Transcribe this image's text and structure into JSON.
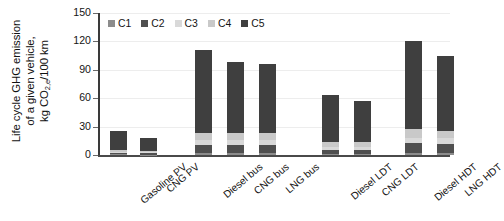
{
  "chart_data": {
    "type": "bar",
    "subtype": "stacked-bar",
    "title": "",
    "xlabel": "",
    "ylabel": "Life cycle GHG emission of a given vehicle, kg CO2,e/100 km",
    "ylabel_lines": [
      "Life cycle GHG emission",
      "of a given vehicle,",
      "kg CO₂,ₑ/100 km"
    ],
    "ylim": [
      0,
      150
    ],
    "yticks": [
      0,
      30,
      60,
      90,
      120,
      150
    ],
    "ytick_labels": [
      "0",
      "30",
      "60",
      "90",
      "120",
      "150"
    ],
    "grid": true,
    "legend_position": "top-left-inside",
    "categories": [
      "Gasoline PV",
      "CNG PV",
      "Diesel bus",
      "CNG bus",
      "LNG bus",
      "Diesel LDT",
      "CNG LDT",
      "Diesel HDT",
      "LNG HDT"
    ],
    "series": [
      {
        "name": "C1",
        "color": "#8c8c8c",
        "values": [
          0.6,
          0.5,
          2.0,
          2.0,
          2.0,
          1.2,
          1.2,
          2.5,
          2.5
        ]
      },
      {
        "name": "C2",
        "color": "#4f4f4f",
        "values": [
          1.8,
          1.6,
          8.6,
          8.7,
          8.8,
          4.6,
          4.6,
          9.8,
          9.6
        ]
      },
      {
        "name": "C3",
        "color": "#d9d9d9",
        "values": [
          1.2,
          1.1,
          5.0,
          5.1,
          5.0,
          3.0,
          3.1,
          6.0,
          5.8
        ]
      },
      {
        "name": "C4",
        "color": "#c9c9c9",
        "values": [
          1.4,
          1.3,
          8.0,
          7.9,
          7.7,
          4.5,
          4.6,
          9.2,
          7.4
        ]
      },
      {
        "name": "C5",
        "color": "#3f3f3f",
        "values": [
          20.5,
          13.5,
          87.4,
          74.3,
          72.5,
          49.7,
          43.5,
          93.5,
          79.7
        ]
      }
    ],
    "totals": [
      25.5,
      18.0,
      111.0,
      98.0,
      96.0,
      63.0,
      57.0,
      121.0,
      105.0
    ],
    "group_gaps_after": [
      "CNG PV",
      "LNG bus",
      "CNG LDT"
    ]
  },
  "legend": {
    "items": [
      {
        "label": "C1",
        "color": "#8c8c8c"
      },
      {
        "label": "C2",
        "color": "#4f4f4f"
      },
      {
        "label": "C3",
        "color": "#d9d9d9"
      },
      {
        "label": "C4",
        "color": "#c9c9c9"
      },
      {
        "label": "C5",
        "color": "#3f3f3f"
      }
    ]
  },
  "colors": {
    "axis": "#3a3a3a",
    "grid": "#ededed",
    "text": "#141414",
    "background": "#ffffff"
  }
}
